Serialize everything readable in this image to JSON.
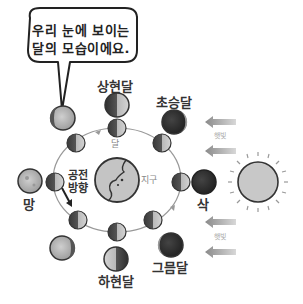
{
  "speech_bubble": {
    "line1": "우리 눈에 보이는",
    "line2": "달의 모습이에요."
  },
  "labels": {
    "first_quarter": "상현달",
    "waxing_crescent": "초승달",
    "new_moon": "삭",
    "waning_crescent": "그믐달",
    "last_quarter": "하현달",
    "full_moon": "망",
    "moon": "달",
    "earth": "지구",
    "orbit_direction_line1": "공전",
    "orbit_direction_line2": "방향",
    "sunlight_top": "햇빛",
    "sunlight_bottom": "햇빛"
  },
  "colors": {
    "dark": "#2b2b2b",
    "light": "#bdbdbd",
    "outline": "#333333",
    "orbit": "#999999",
    "arrow": "#9a9a9a",
    "sun_fill": "#c8c8c8"
  },
  "sun": {
    "cx": 258,
    "cy": 182,
    "r": 20
  },
  "earth": {
    "cx": 117,
    "cy": 180,
    "r": 22
  },
  "orbit": {
    "cx": 117,
    "cy": 180,
    "rx": 64,
    "ry": 52
  }
}
